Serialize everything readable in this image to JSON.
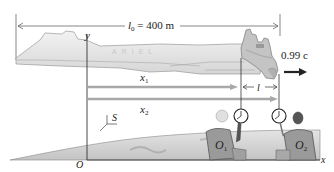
{
  "diagram": {
    "type": "relativity-length-contraction",
    "labels": {
      "proper_length": {
        "symbol": "l",
        "subscript": "0",
        "value": "= 400 m"
      },
      "velocity": "0.99 c",
      "contracted_length": "l",
      "y_axis": "y",
      "x_axis": "x",
      "origin": "O",
      "frame": "S",
      "x1": {
        "symbol": "x",
        "subscript": "1"
      },
      "x2": {
        "symbol": "x",
        "subscript": "2"
      },
      "observer1": {
        "symbol": "O",
        "subscript": "1"
      },
      "observer2": {
        "symbol": "O",
        "subscript": "2"
      },
      "ship_name": "ARIEL"
    },
    "colors": {
      "axis": "#333333",
      "arrow_gray": "#a8a8a8",
      "ship_light": "#e8e8e8",
      "ship_dark": "#b8b8b8",
      "ground": "#d0d0d0",
      "velocity_arrow": "#222222"
    },
    "elements": {
      "spaceship": "Ariel spaceship moving right",
      "clock1": "clock-icon",
      "clock2": "clock-icon",
      "observers": 2
    }
  }
}
